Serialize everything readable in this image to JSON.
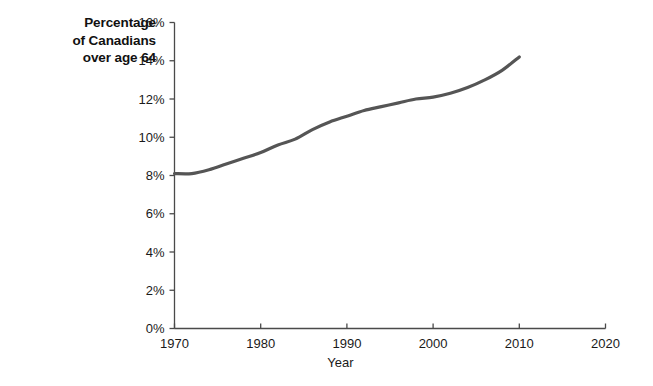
{
  "chart_data": {
    "type": "line",
    "title": "",
    "ylabel": "Percentage of Canadians over age 64",
    "ylabel_lines": [
      "Percentage",
      "of Canadians",
      "over age 64"
    ],
    "xlabel": "Year",
    "xlim": [
      1970,
      2020
    ],
    "ylim": [
      0,
      16
    ],
    "grid": false,
    "legend": null,
    "x_tick_labels": [
      "1970",
      "1980",
      "1990",
      "2000",
      "2010",
      "2020"
    ],
    "x_ticks": [
      1970,
      1980,
      1990,
      2000,
      2010,
      2020
    ],
    "y_tick_labels": [
      "0%",
      "2%",
      "4%",
      "6%",
      "8%",
      "10%",
      "12%",
      "14%",
      "16%"
    ],
    "y_ticks": [
      0,
      2,
      4,
      6,
      8,
      10,
      12,
      14,
      16
    ],
    "y_unit": "%",
    "series": [
      {
        "name": "Percentage of Canadians over age 64",
        "color": "#555555",
        "line_width": 3.2,
        "x": [
          1970,
          1972,
          1974,
          1976,
          1978,
          1980,
          1982,
          1984,
          1986,
          1988,
          1990,
          1992,
          1994,
          1996,
          1998,
          2000,
          2002,
          2004,
          2006,
          2008,
          2010
        ],
        "values": [
          8.1,
          8.1,
          8.3,
          8.6,
          8.9,
          9.2,
          9.6,
          9.9,
          10.4,
          10.8,
          11.1,
          11.4,
          11.6,
          11.8,
          12.0,
          12.1,
          12.3,
          12.6,
          13.0,
          13.5,
          14.2
        ]
      }
    ]
  }
}
